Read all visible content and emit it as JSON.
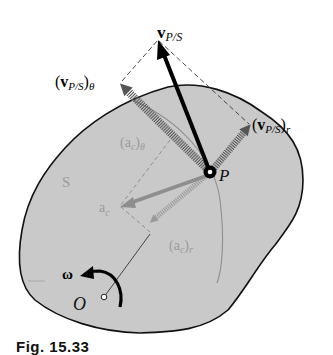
{
  "figure": {
    "caption": "Fig. 15.33",
    "colors": {
      "body_fill": "#c9c9c9",
      "outline": "#111111",
      "gray_label": "#9a9a9a",
      "gray_vector": "#8e8e8e",
      "black_vector": "#000000"
    },
    "labels": {
      "v_ps": "v",
      "v_ps_sub": "P/S",
      "v_ps_theta_open": "(",
      "v_ps_theta_close": ")",
      "v_ps_theta_sub_outer": "θ",
      "v_ps_r_sub_outer": "r",
      "point_p": "P",
      "body_s": "S",
      "ac": "a",
      "ac_sub": "c",
      "ac_theta_open": "(a",
      "ac_theta_close": ")",
      "ac_theta_sub_outer": "θ",
      "ac_r_open": "(a",
      "ac_r_close": ")",
      "ac_r_sub_outer": "r",
      "omega": "ω",
      "origin": "O"
    }
  }
}
